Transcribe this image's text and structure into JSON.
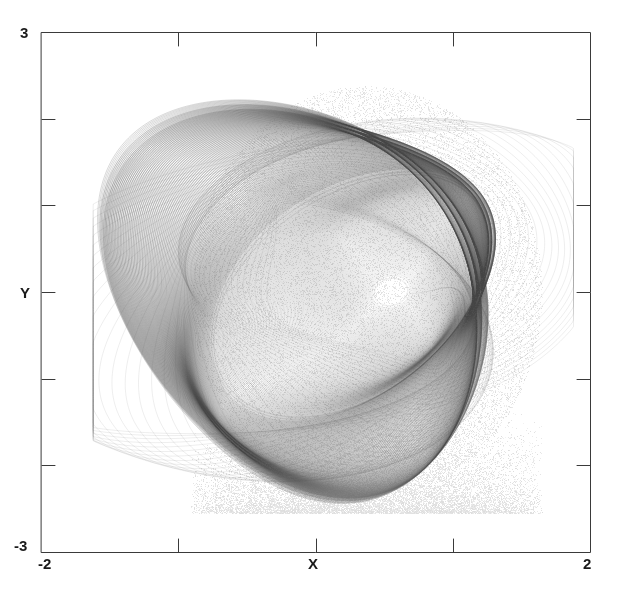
{
  "figure": {
    "kind": "phase-portrait",
    "background_color": "#ffffff",
    "frame_color": "#3a3a3a",
    "trace_color": "#555555",
    "width": 617,
    "height": 601
  },
  "axes": {
    "x_label": "X",
    "y_label": "Y",
    "x_min_label": "-2",
    "x_max_label": "2",
    "y_min_label": "-3",
    "y_max_label": "3"
  },
  "chart_data": {
    "type": "scatter",
    "title": "",
    "subtitle": "",
    "xlabel": "X",
    "ylabel": "Y",
    "xlim": [
      -2,
      2
    ],
    "ylim": [
      -3,
      3
    ],
    "xticks": [
      -1,
      0,
      1
    ],
    "yticks": [
      -2,
      -1,
      0,
      1,
      2
    ],
    "xticklabels": [
      "",
      "",
      ""
    ],
    "yticklabels": [
      "",
      "",
      "",
      "",
      ""
    ],
    "x_corner_labels": [
      "-2",
      "2"
    ],
    "y_corner_labels": [
      "-3",
      "3"
    ],
    "grid": false,
    "legend": false,
    "legend_position": "none",
    "tick_direction": "in",
    "annotations": [],
    "series": [
      {
        "name": "trajectory",
        "description": "Chaotic attractor phase-space trajectory: dense nested quasi-elliptical orbits",
        "color": "#555555",
        "marker": "point",
        "linewidth": 0.45,
        "point_count": 160000,
        "x_extent": [
          -1.62,
          1.88
        ],
        "y_extent": [
          -2.55,
          2.62
        ],
        "orbit_center": [
          0.55,
          0.0
        ],
        "densest_region": "left and upper-left limb",
        "generator": {
          "model": "forced-duffing-oscillator",
          "equations": "x' = y ; y' = x - x^3 - delta*y + gamma*cos(omega*t)",
          "delta": 0.22,
          "gamma": 0.3,
          "omega": 1.0,
          "dt": 0.0045,
          "x0": 0.62,
          "y0": 0.02,
          "t0": 0.0
        }
      }
    ]
  }
}
